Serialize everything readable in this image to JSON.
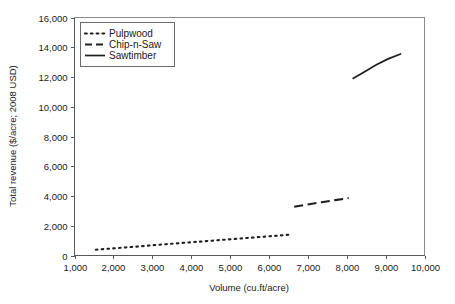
{
  "chart_data": {
    "type": "line",
    "title": "",
    "xlabel": "Volume (cu.ft/acre)",
    "ylabel": "Total revenue ($/acre; 2008 USD)",
    "xlim": [
      1000,
      10000
    ],
    "ylim": [
      0,
      16000
    ],
    "xticks": [
      "1,000",
      "2,000",
      "3,000",
      "4,000",
      "5,000",
      "6,000",
      "7,000",
      "8,000",
      "9,000",
      "10,000"
    ],
    "xtick_values": [
      1000,
      2000,
      3000,
      4000,
      5000,
      6000,
      7000,
      8000,
      9000,
      10000
    ],
    "yticks": [
      "0",
      "2,000",
      "4,000",
      "6,000",
      "8,000",
      "10,000",
      "12,000",
      "14,000",
      "16,000"
    ],
    "ytick_values": [
      0,
      2000,
      4000,
      6000,
      8000,
      10000,
      12000,
      14000,
      16000
    ],
    "grid": false,
    "legend_position": "top-left",
    "series": [
      {
        "name": "Pulpwood",
        "style": "dotted",
        "color": "#1f1f1f",
        "x": [
          1550,
          1950,
          2350,
          2750,
          3150,
          3550,
          3950,
          4350,
          4750,
          5150,
          5550,
          5950,
          6350,
          6600
        ],
        "y": [
          390,
          470,
          550,
          630,
          720,
          800,
          880,
          960,
          1040,
          1120,
          1200,
          1280,
          1360,
          1420
        ]
      },
      {
        "name": "Chip-n-Saw",
        "style": "dashed",
        "color": "#1f1f1f",
        "x": [
          6650,
          7000,
          7350,
          7700,
          8050
        ],
        "y": [
          3280,
          3430,
          3580,
          3720,
          3860
        ]
      },
      {
        "name": "Sawtimber",
        "style": "solid",
        "color": "#1f1f1f",
        "x": [
          8150,
          8450,
          8750,
          9050,
          9400
        ],
        "y": [
          11880,
          12340,
          12800,
          13200,
          13560
        ]
      }
    ]
  },
  "legend": {
    "items": [
      {
        "label": "Pulpwood",
        "style": "dotted"
      },
      {
        "label": "Chip-n-Saw",
        "style": "dashed"
      },
      {
        "label": "Sawtimber",
        "style": "solid"
      }
    ]
  },
  "axes": {
    "x_title": "Volume (cu.ft/acre)",
    "y_title": "Total revenue ($/acre; 2008 USD)"
  }
}
